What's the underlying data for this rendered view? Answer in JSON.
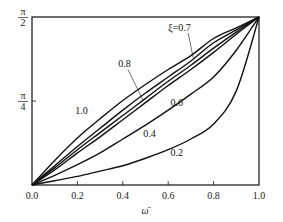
{
  "chart_data": {
    "type": "line",
    "title": "",
    "xlabel": "ω̄",
    "ylabel": "",
    "xlim": [
      0.0,
      1.0
    ],
    "ylim": [
      0,
      1.5708
    ],
    "grid": false,
    "legend": "inline curve labels",
    "x_ticks": [
      "0.0",
      "0.2",
      "0.4",
      "0.6",
      "0.8",
      "1.0"
    ],
    "y_ticks": [
      {
        "value": 0.7854,
        "label_num": "π",
        "label_den": "4"
      },
      {
        "value": 1.5708,
        "label_num": "π",
        "label_den": "2"
      }
    ],
    "x": [
      0.0,
      0.1,
      0.2,
      0.3,
      0.4,
      0.5,
      0.6,
      0.7,
      0.8,
      0.9,
      1.0
    ],
    "series": [
      {
        "name": "ξ=1.0",
        "label": "1.0",
        "values": [
          0.0,
          0.23,
          0.44,
          0.62,
          0.79,
          0.94,
          1.08,
          1.21,
          1.37,
          1.47,
          1.5708
        ]
      },
      {
        "name": "ξ=0.8",
        "label": "0.8",
        "values": [
          0.0,
          0.18,
          0.36,
          0.53,
          0.7,
          0.86,
          1.01,
          1.16,
          1.33,
          1.45,
          1.5708
        ]
      },
      {
        "name": "ξ=0.7",
        "label": "ξ=0.7",
        "values": [
          0.0,
          0.16,
          0.33,
          0.49,
          0.65,
          0.81,
          0.97,
          1.12,
          1.28,
          1.43,
          1.5708
        ]
      },
      {
        "name": "ξ=0.6",
        "label": "0.6",
        "values": [
          0.0,
          0.14,
          0.3,
          0.45,
          0.61,
          0.77,
          0.93,
          1.08,
          1.24,
          1.41,
          1.5708
        ]
      },
      {
        "name": "ξ=0.4",
        "label": "0.4",
        "values": [
          0.0,
          0.09,
          0.19,
          0.3,
          0.43,
          0.56,
          0.7,
          0.85,
          1.01,
          1.26,
          1.5708
        ]
      },
      {
        "name": "ξ=0.2",
        "label": "0.2",
        "values": [
          0.0,
          0.04,
          0.08,
          0.13,
          0.18,
          0.25,
          0.33,
          0.43,
          0.57,
          0.88,
          1.5708
        ]
      }
    ],
    "annotations": [
      {
        "text": "ξ=0.7",
        "x": 0.6,
        "y": 1.44,
        "leader_to": {
          "x": 0.71,
          "y": 1.19
        }
      },
      {
        "text": "0.8",
        "x": 0.38,
        "y": 1.1,
        "leader_to": {
          "x": 0.49,
          "y": 0.79
        }
      },
      {
        "text": "1.0",
        "x": 0.19,
        "y": 0.66
      },
      {
        "text": "0.6",
        "x": 0.61,
        "y": 0.74
      },
      {
        "text": "0.4",
        "x": 0.49,
        "y": 0.45
      },
      {
        "text": "0.2",
        "x": 0.61,
        "y": 0.27
      }
    ]
  }
}
